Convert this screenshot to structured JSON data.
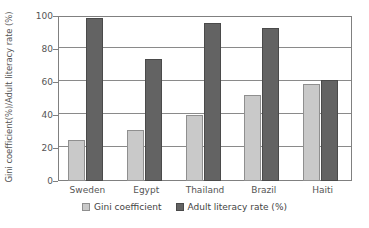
{
  "chart_data": {
    "type": "bar",
    "title": "",
    "xlabel": "",
    "ylabel": "Gini coefficient(%)/Adult literacy rate (%)",
    "ylim": [
      0,
      100
    ],
    "yticks": [
      0,
      20,
      40,
      60,
      80,
      100
    ],
    "ytick_labels": [
      "0",
      "20",
      "40",
      "60",
      "80",
      "100"
    ],
    "grid": true,
    "legend_position": "bottom",
    "categories": [
      "Sweden",
      "Egypt",
      "Thailand",
      "Brazil",
      "Haiti"
    ],
    "series": [
      {
        "name": "Gini coefficient",
        "color": "#c9c9c9",
        "values": [
          25,
          31,
          40,
          52,
          59
        ]
      },
      {
        "name": "Adult literacy rate (%)",
        "color": "#636363",
        "values": [
          99,
          74,
          96,
          92.5,
          61
        ]
      }
    ]
  }
}
